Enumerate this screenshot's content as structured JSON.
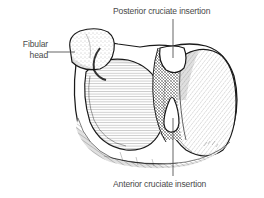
{
  "figure": {
    "background_color": "#ffffff",
    "ink_color": "#1a1a1a",
    "label_color": "#4a4a4a"
  },
  "labels": {
    "posterior_cruciate": "Posterior cruciate insertion",
    "anterior_cruciate": "Anterior cruciate insertion",
    "fibular_head_line1": "Fibular",
    "fibular_head_line2": "head"
  },
  "leaders": {
    "posterior_label": "leader-line-posterior-cruciate",
    "anterior_label": "leader-line-anterior-cruciate",
    "fibular_label": "leader-line-fibular-head"
  }
}
